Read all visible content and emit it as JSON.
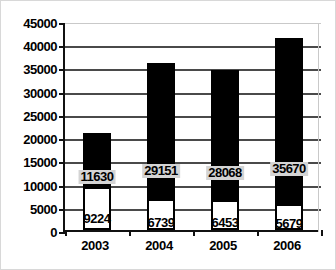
{
  "chart_data": {
    "type": "bar",
    "subtype": "stacked-bar",
    "title": "",
    "xlabel": "",
    "ylabel": "",
    "categories": [
      "2003",
      "2004",
      "2005",
      "2006"
    ],
    "series": [
      {
        "name": "lower",
        "style": "white-fill-black-outline",
        "color": "#ffffff",
        "values": [
          9224,
          6739,
          6453,
          5679
        ]
      },
      {
        "name": "upper",
        "style": "black-fill",
        "color": "#000000",
        "values": [
          11630,
          29151,
          28068,
          35670
        ]
      }
    ],
    "totals": [
      20854,
      35890,
      34521,
      41349
    ],
    "ylim": [
      0,
      45000
    ],
    "ytick_step": 5000,
    "yticks": [
      0,
      5000,
      10000,
      15000,
      20000,
      25000,
      30000,
      35000,
      40000,
      45000
    ],
    "ytick_labels": [
      "0",
      "5000",
      "10000",
      "15000",
      "20000",
      "25000",
      "30000",
      "35000",
      "40000",
      "45000"
    ],
    "grid": true,
    "grid_orientation": "horizontal",
    "legend": false,
    "data_labels": {
      "lower": [
        "9224",
        "6739",
        "6453",
        "5679"
      ],
      "upper": [
        "11630",
        "29151",
        "28068",
        "35670"
      ],
      "upper_label_background": "#d4d4d4"
    },
    "axis_color": "#111111",
    "gridline_color": "#4a4a4a",
    "background": "#ffffff",
    "border_color": "#d8d8d8"
  }
}
